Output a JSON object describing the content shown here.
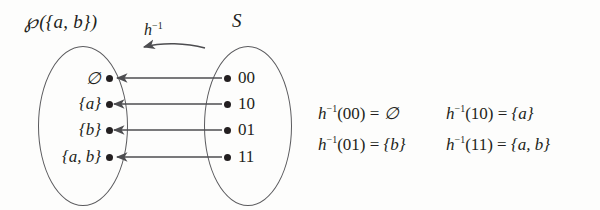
{
  "diagram": {
    "domain_set": {
      "label_script": "℘",
      "label_rest": "({a, b})",
      "elements": [
        "∅",
        "{a}",
        "{b}",
        "{a, b}"
      ]
    },
    "codomain_set": {
      "label": "S",
      "elements": [
        "00",
        "10",
        "01",
        "11"
      ]
    },
    "mapping_label": {
      "base": "h",
      "exponent": "−1"
    },
    "equations": [
      {
        "fn": "h",
        "exp": "−1",
        "arg": "(00)",
        "eq": "=",
        "value": "∅"
      },
      {
        "fn": "h",
        "exp": "−1",
        "arg": "(10)",
        "eq": "=",
        "value": "{a}"
      },
      {
        "fn": "h",
        "exp": "−1",
        "arg": "(01)",
        "eq": "=",
        "value": "{b}"
      },
      {
        "fn": "h",
        "exp": "−1",
        "arg": "(11)",
        "eq": "=",
        "value": "{a, b}"
      }
    ],
    "colors": {
      "ink": "#231f20",
      "stroke": "#5b5b5e",
      "background": "#fdfdfc"
    }
  }
}
